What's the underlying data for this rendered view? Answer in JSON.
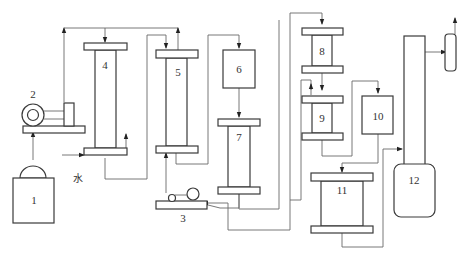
{
  "diagram": {
    "type": "process-flow",
    "units": [
      {
        "id": "1",
        "label": "1",
        "shape": "tank-with-dome"
      },
      {
        "id": "2",
        "label": "2",
        "shape": "pump-on-base"
      },
      {
        "id": "3",
        "label": "3",
        "shape": "pump-on-base"
      },
      {
        "id": "4",
        "label": "4",
        "shape": "column"
      },
      {
        "id": "5",
        "label": "5",
        "shape": "column"
      },
      {
        "id": "6",
        "label": "6",
        "shape": "box"
      },
      {
        "id": "7",
        "label": "7",
        "shape": "column"
      },
      {
        "id": "8",
        "label": "8",
        "shape": "column"
      },
      {
        "id": "9",
        "label": "9",
        "shape": "column"
      },
      {
        "id": "10",
        "label": "10",
        "shape": "box"
      },
      {
        "id": "11",
        "label": "11",
        "shape": "column"
      },
      {
        "id": "12",
        "label": "12",
        "shape": "tall-tower-with-vessel"
      },
      {
        "id": "13",
        "label": "",
        "shape": "small-rounded-vessel"
      }
    ],
    "annotations": {
      "water_label": "水"
    },
    "flows": [
      {
        "from": "1",
        "to": "2"
      },
      {
        "from": "2",
        "to": "4",
        "via": "top-header"
      },
      {
        "from": "water",
        "to": "4",
        "entry": "bottom"
      },
      {
        "from": "4",
        "to": "5"
      },
      {
        "from": "5",
        "to": "6"
      },
      {
        "from": "6",
        "to": "7"
      },
      {
        "from": "3",
        "to": "5",
        "entry": "bottom"
      },
      {
        "from": "7",
        "to": "3"
      },
      {
        "from": "3",
        "to": "8",
        "via": "top-header"
      },
      {
        "from": "8",
        "to": "9"
      },
      {
        "from": "9",
        "to": "10"
      },
      {
        "from": "10",
        "to": "11"
      },
      {
        "from": "11",
        "to": "12"
      },
      {
        "from": "12",
        "to": "13"
      },
      {
        "from": "13",
        "to": "outlet"
      }
    ]
  }
}
